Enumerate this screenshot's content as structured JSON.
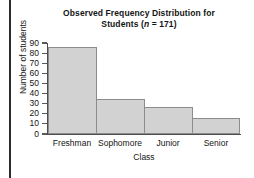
{
  "chart_data": {
    "type": "bar",
    "title": "Observed Frequency Distribution for Students (n = 171)",
    "title_line1": "Observed Frequency Distribution for",
    "title_line2_prefix": "Students (",
    "title_line2_italic": "n",
    "title_line2_suffix": " = 171)",
    "categories": [
      "Freshman",
      "Sophomore",
      "Junior",
      "Senior"
    ],
    "values": [
      86,
      35,
      27,
      16
    ],
    "xlabel": "Class",
    "ylabel": "Number of students",
    "ylim": [
      0,
      90
    ],
    "ytick_step": 10,
    "yticks": [
      "90",
      "80",
      "70",
      "60",
      "50",
      "40",
      "30",
      "20",
      "10",
      "0"
    ],
    "grid": false,
    "legend": null,
    "bar_fill_color": "#d2d2d2",
    "bar_border_color": "#8c8c8c",
    "axis_color": "#4d4d4d",
    "background_color": "#ffffff",
    "sample_size": 171
  }
}
